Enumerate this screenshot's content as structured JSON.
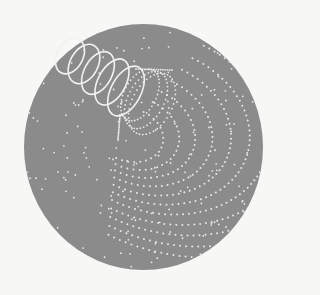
{
  "canvas": {
    "width": 282,
    "height": 295,
    "background": "#f7f7f5"
  },
  "disk": {
    "cx": 143.5,
    "cy": 147,
    "rx": 119.5,
    "ry": 123,
    "fill": "#8b8b8b"
  },
  "colors": {
    "dot": "#e9e9e9",
    "helix": "#f2f2f2"
  },
  "helix": {
    "loops": [
      {
        "cx": 70,
        "cy": 56,
        "rx": 13,
        "ry": 19,
        "rot": 28
      },
      {
        "cx": 84,
        "cy": 64,
        "rx": 14,
        "ry": 21,
        "rot": 28
      },
      {
        "cx": 98,
        "cy": 73,
        "rx": 14,
        "ry": 23,
        "rot": 28
      },
      {
        "cx": 112,
        "cy": 82,
        "rx": 14,
        "ry": 25,
        "rot": 28
      },
      {
        "cx": 126,
        "cy": 91,
        "rx": 15,
        "ry": 27,
        "rot": 28
      }
    ],
    "stroke_width": 1.6
  },
  "funnel": {
    "rings": [
      {
        "cx": 140,
        "cy": 95,
        "rx": 16,
        "ry": 28,
        "rot": 28
      },
      {
        "cx": 146,
        "cy": 100,
        "rx": 18,
        "ry": 31,
        "rot": 28
      },
      {
        "cx": 152,
        "cy": 104,
        "rx": 20,
        "ry": 33,
        "rot": 28
      }
    ],
    "tip": {
      "x": 118,
      "y": 140
    },
    "top": {
      "x": 172,
      "y": 70
    }
  },
  "arcs": {
    "origin": {
      "x": 118,
      "y": 140
    },
    "start_deg": -80,
    "end_deg": 100,
    "radii": [
      34,
      46,
      58,
      71,
      85,
      99,
      114,
      130,
      146,
      163,
      180
    ],
    "squash": 0.78,
    "rot": 18,
    "spacing": 6.2
  },
  "scatter": {
    "count": 140,
    "seed": 7
  }
}
